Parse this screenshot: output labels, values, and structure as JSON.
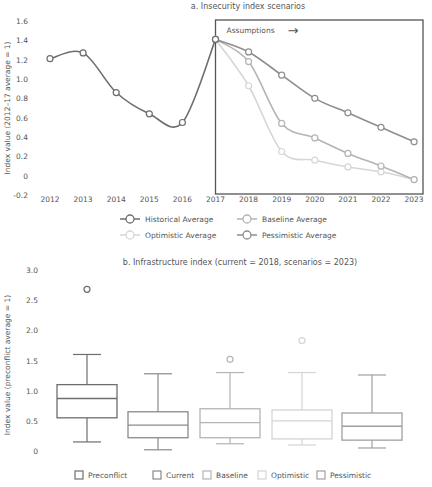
{
  "chart_data": [
    {
      "type": "line",
      "title": "a. Insecurity index scenarios",
      "xlabel": "",
      "ylabel": "Index value (2012–17 average = 1)",
      "ylim": [
        -0.2,
        1.6
      ],
      "yticks": [
        "1.6",
        "1.4",
        "1.2",
        "1.0",
        "0.8",
        "0.6",
        "0.4",
        "0.2",
        "0",
        "-0.2"
      ],
      "x": [
        "2012",
        "2013",
        "2014",
        "2015",
        "2016",
        "2017",
        "2018",
        "2019",
        "2020",
        "2021",
        "2022",
        "2023"
      ],
      "grid": false,
      "legend_position": "bottom",
      "annotation": {
        "label": "Assumptions",
        "arrow": "→",
        "box_from": "2017",
        "box_to": "2023"
      },
      "series": [
        {
          "name": "Historical Average",
          "color": "#6e6e6e",
          "values": [
            1.21,
            1.27,
            0.86,
            0.64,
            0.55,
            1.41,
            null,
            null,
            null,
            null,
            null,
            null
          ]
        },
        {
          "name": "Baseline Average",
          "color": "#b4b4b4",
          "values": [
            null,
            null,
            null,
            null,
            null,
            1.41,
            1.18,
            0.54,
            0.39,
            0.23,
            0.1,
            -0.04
          ]
        },
        {
          "name": "Optimistic Average",
          "color": "#d6d6d6",
          "values": [
            null,
            null,
            null,
            null,
            null,
            1.41,
            0.93,
            0.25,
            0.16,
            0.09,
            0.04,
            -0.04
          ]
        },
        {
          "name": "Pessimistic Average",
          "color": "#8e8e8e",
          "values": [
            null,
            null,
            null,
            null,
            null,
            1.41,
            1.28,
            1.04,
            0.8,
            0.65,
            0.5,
            0.35
          ]
        }
      ]
    },
    {
      "type": "box",
      "title": "b. Infrastructure index (current = 2018, scenarios = 2023)",
      "xlabel": "",
      "ylabel": "Index value (preconflict average = 1)",
      "ylim": [
        0,
        3.0
      ],
      "yticks": [
        "3.0",
        "2.5",
        "2.0",
        "1.5",
        "1.0",
        "0.5",
        "0"
      ],
      "grid": false,
      "legend_position": "bottom",
      "categories": [
        "Preconflict",
        "Current",
        "Baseline",
        "Optimistic",
        "Pessimistic"
      ],
      "series": [
        {
          "name": "Preconflict",
          "color": "#6e6e6e",
          "whisker_low": 0.15,
          "q1": 0.55,
          "median": 0.87,
          "q3": 1.1,
          "whisker_high": 1.6,
          "outliers": [
            2.68
          ]
        },
        {
          "name": "Current",
          "color": "#8a8a8a",
          "whisker_low": 0.02,
          "q1": 0.22,
          "median": 0.43,
          "q3": 0.65,
          "whisker_high": 1.28,
          "outliers": []
        },
        {
          "name": "Baseline",
          "color": "#b4b4b4",
          "whisker_low": 0.12,
          "q1": 0.22,
          "median": 0.47,
          "q3": 0.7,
          "whisker_high": 1.3,
          "outliers": [
            1.52
          ]
        },
        {
          "name": "Optimistic",
          "color": "#d4d4d4",
          "whisker_low": 0.1,
          "q1": 0.2,
          "median": 0.5,
          "q3": 0.68,
          "whisker_high": 1.3,
          "outliers": [
            1.83
          ]
        },
        {
          "name": "Pessimistic",
          "color": "#a0a0a0",
          "whisker_low": 0.05,
          "q1": 0.18,
          "median": 0.41,
          "q3": 0.63,
          "whisker_high": 1.26,
          "outliers": []
        }
      ]
    }
  ]
}
